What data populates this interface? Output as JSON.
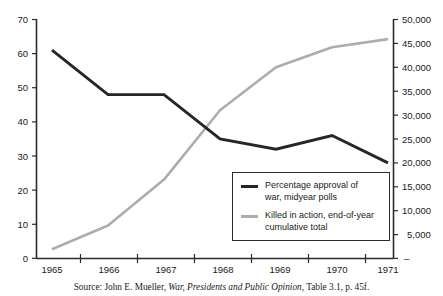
{
  "chart_data": {
    "type": "line",
    "title": "",
    "xlabel": "",
    "categories": [
      "1965",
      "1966",
      "1967",
      "1968",
      "1969",
      "1970",
      "1971"
    ],
    "x": [
      1965,
      1966,
      1967,
      1968,
      1969,
      1970,
      1971
    ],
    "grid": false,
    "legend_position": "inside-bottom-right",
    "axes": {
      "left": {
        "label": "",
        "ylim": [
          0,
          70
        ],
        "ticks": [
          0,
          10,
          20,
          30,
          40,
          50,
          60,
          70
        ],
        "tick_labels": [
          "0",
          "10",
          "20",
          "30",
          "40",
          "50",
          "60",
          "70"
        ]
      },
      "right": {
        "label": "",
        "ylim": [
          0,
          50000
        ],
        "ticks": [
          0,
          5000,
          10000,
          15000,
          20000,
          25000,
          30000,
          35000,
          40000,
          45000,
          50000
        ],
        "tick_labels": [
          "–",
          "5,000",
          "10,000",
          "15,000",
          "20,000",
          "25,000",
          "30,000",
          "35,000",
          "40,000",
          "45,000",
          "50,000"
        ]
      }
    },
    "series": [
      {
        "name": "Percentage approval of war, midyear polls",
        "axis": "left",
        "color": "#262626",
        "values": [
          61,
          48,
          48,
          35,
          32,
          36,
          28
        ]
      },
      {
        "name": "Killed in action, end-of-year cumulative total",
        "axis": "right",
        "color": "#adadad",
        "values": [
          1900,
          6900,
          16500,
          31000,
          40000,
          44200,
          45900
        ]
      }
    ],
    "legend": [
      {
        "label": "Percentage approval of\nwar, midyear polls",
        "color": "#262626",
        "swatch": "thick-line"
      },
      {
        "label": "Killed in action, end-of-year\ncumulative total",
        "color": "#adadad",
        "swatch": "thick-line"
      }
    ]
  },
  "source_note": {
    "prefix": "Source: John E. Mueller, ",
    "work_title": "War, Presidents and Public Opinion",
    "suffix": ", Table 3.1, p. 45f."
  }
}
